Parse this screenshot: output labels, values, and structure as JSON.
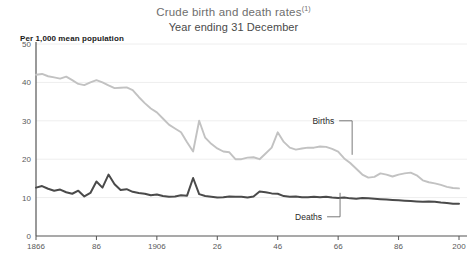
{
  "chart_data": {
    "type": "line",
    "title": "Crude birth and death rates",
    "title_superscript": "(1)",
    "subtitle": "Year ending 31 December",
    "ylabel": "Per 1,000 mean population",
    "xlabel": "",
    "grid": true,
    "legend_position": "inline-annotation",
    "ylim": [
      0,
      50
    ],
    "xlim": [
      1866,
      2006
    ],
    "yticks": [
      "0",
      "10",
      "20",
      "30",
      "40",
      "50"
    ],
    "ytick_values": [
      0,
      10,
      20,
      30,
      40,
      50
    ],
    "xticks": [
      "1866",
      "86",
      "1906",
      "26",
      "46",
      "66",
      "86",
      "200"
    ],
    "xtick_values": [
      1866,
      1886,
      1906,
      1926,
      1946,
      1966,
      1986,
      2006
    ],
    "colors": {
      "births": "#c2c2c2",
      "deaths": "#4a4a4a",
      "grid": "#eeeeee",
      "axis": "#555555",
      "title": "#6e6e6e",
      "subtitle": "#4a4a4a",
      "tick_text": "#5a5a5a",
      "annotation_text": "#2a2a2a"
    },
    "series": [
      {
        "name": "Births",
        "color": "#c2c2c2",
        "x": [
          1866,
          1868,
          1870,
          1872,
          1874,
          1876,
          1878,
          1880,
          1882,
          1884,
          1886,
          1888,
          1890,
          1892,
          1894,
          1896,
          1898,
          1900,
          1902,
          1904,
          1906,
          1908,
          1910,
          1912,
          1914,
          1916,
          1918,
          1920,
          1922,
          1924,
          1926,
          1928,
          1930,
          1932,
          1934,
          1936,
          1938,
          1940,
          1942,
          1944,
          1946,
          1948,
          1950,
          1952,
          1954,
          1956,
          1958,
          1960,
          1962,
          1964,
          1966,
          1968,
          1970,
          1972,
          1974,
          1976,
          1978,
          1980,
          1982,
          1984,
          1986,
          1988,
          1990,
          1992,
          1994,
          1996,
          1998,
          2000,
          2002,
          2004,
          2006
        ],
        "values": [
          42.0,
          42.2,
          41.6,
          41.3,
          41.0,
          41.5,
          40.6,
          39.6,
          39.3,
          40.0,
          40.6,
          40.0,
          39.2,
          38.5,
          38.6,
          38.7,
          38.0,
          36.2,
          34.6,
          33.2,
          32.2,
          30.6,
          29.0,
          28.0,
          27.0,
          24.4,
          22.0,
          30.0,
          25.6,
          24.0,
          22.8,
          22.0,
          21.8,
          20.0,
          20.0,
          20.4,
          20.5,
          20.0,
          21.5,
          23.0,
          27.0,
          24.5,
          23.0,
          22.5,
          22.8,
          23.0,
          23.0,
          23.3,
          23.2,
          22.7,
          22.0,
          20.2,
          19.0,
          17.5,
          16.0,
          15.2,
          15.4,
          16.3,
          16.0,
          15.5,
          16.0,
          16.3,
          16.5,
          15.8,
          14.5,
          14.0,
          13.7,
          13.3,
          12.8,
          12.5,
          12.4
        ]
      },
      {
        "name": "Deaths",
        "color": "#4a4a4a",
        "x": [
          1866,
          1868,
          1870,
          1872,
          1874,
          1876,
          1878,
          1880,
          1882,
          1884,
          1886,
          1888,
          1890,
          1892,
          1894,
          1896,
          1898,
          1900,
          1902,
          1904,
          1906,
          1908,
          1910,
          1912,
          1914,
          1916,
          1918,
          1920,
          1922,
          1924,
          1926,
          1928,
          1930,
          1932,
          1934,
          1936,
          1938,
          1940,
          1942,
          1944,
          1946,
          1948,
          1950,
          1952,
          1954,
          1956,
          1958,
          1960,
          1962,
          1964,
          1966,
          1968,
          1970,
          1972,
          1974,
          1976,
          1978,
          1980,
          1982,
          1984,
          1986,
          1988,
          1990,
          1992,
          1994,
          1996,
          1998,
          2000,
          2002,
          2004,
          2006
        ],
        "values": [
          12.6,
          13.0,
          12.3,
          11.8,
          12.1,
          11.4,
          11.0,
          11.8,
          10.3,
          11.2,
          14.2,
          12.6,
          16.0,
          13.5,
          12.0,
          12.2,
          11.5,
          11.2,
          11.0,
          10.6,
          10.8,
          10.4,
          10.2,
          10.3,
          10.6,
          10.5,
          15.1,
          10.9,
          10.4,
          10.2,
          10.0,
          10.1,
          10.3,
          10.2,
          10.2,
          10.0,
          10.3,
          11.6,
          11.4,
          11.1,
          11.0,
          10.4,
          10.2,
          10.3,
          10.1,
          10.1,
          10.2,
          10.1,
          10.2,
          10.0,
          9.9,
          10.0,
          9.8,
          9.7,
          9.9,
          9.8,
          9.7,
          9.6,
          9.5,
          9.4,
          9.3,
          9.2,
          9.1,
          9.0,
          8.9,
          9.0,
          8.9,
          8.7,
          8.6,
          8.4,
          8.4
        ]
      }
    ],
    "annotations": [
      {
        "text": "Births",
        "x": 1966,
        "y": 30
      },
      {
        "text": "Deaths",
        "x": 1962,
        "y": 5
      }
    ]
  }
}
